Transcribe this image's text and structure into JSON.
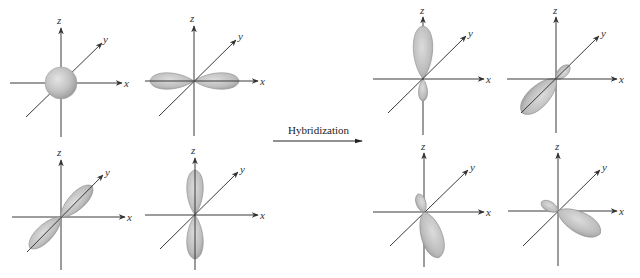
{
  "diagram": {
    "arrow_label": "Hybridization",
    "axis_labels": {
      "x": "x",
      "y": "y",
      "z": "z"
    },
    "colors": {
      "orbital_fill": "#b8b8b8",
      "orbital_edge": "#8c8c8c",
      "axis": "#3a3a3a",
      "background": "#ffffff"
    },
    "before": [
      {
        "id": "s",
        "description": "s orbital (sphere at origin)"
      },
      {
        "id": "px",
        "description": "p orbital along x axis"
      },
      {
        "id": "py",
        "description": "p orbital along y axis"
      },
      {
        "id": "pz",
        "description": "p orbital along z axis"
      }
    ],
    "after": [
      {
        "id": "sp3-1",
        "description": "sp3 hybrid orbital pointing up (+z)"
      },
      {
        "id": "sp3-2",
        "description": "sp3 hybrid orbital pointing toward -y (front lower-left)"
      },
      {
        "id": "sp3-3",
        "description": "sp3 hybrid orbital pointing down-right"
      },
      {
        "id": "sp3-4",
        "description": "sp3 hybrid orbital pointing toward +x lower-right"
      }
    ]
  }
}
